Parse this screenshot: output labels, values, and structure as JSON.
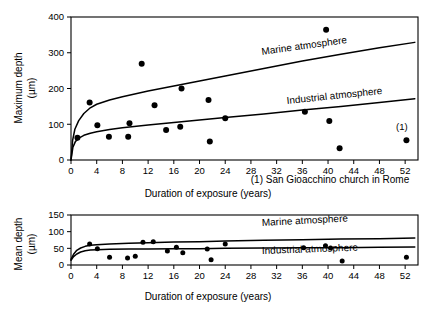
{
  "figure": {
    "footnote": "(1) San Gioacchino church in Rome",
    "point_annotation": "(1)"
  },
  "chart_data": [
    {
      "type": "scatter",
      "id": "maximum-depth",
      "title": "",
      "xlabel": "Duration of exposure (years)",
      "ylabel": "Maximum depth (µm)",
      "ylabel_line1": "Maximum depth",
      "ylabel_line2": "(µm)",
      "xlim": [
        0,
        54
      ],
      "ylim": [
        0,
        400
      ],
      "xticks": [
        0,
        4,
        8,
        12,
        16,
        20,
        24,
        28,
        32,
        36,
        40,
        44,
        48,
        52
      ],
      "yticks": [
        0,
        100,
        200,
        300,
        400
      ],
      "xticklabels": [
        "0",
        "4",
        "8",
        "12",
        "16",
        "20",
        "24",
        "28",
        "32",
        "36",
        "40",
        "44",
        "48",
        "52"
      ],
      "yticklabels": [
        "0",
        "100",
        "200",
        "300",
        "400"
      ],
      "grid": false,
      "legend_position": "inline-curve-labels",
      "points": [
        {
          "x": 1.0,
          "y": 62
        },
        {
          "x": 2.9,
          "y": 161
        },
        {
          "x": 4.1,
          "y": 97
        },
        {
          "x": 5.9,
          "y": 65
        },
        {
          "x": 8.9,
          "y": 65
        },
        {
          "x": 9.1,
          "y": 103
        },
        {
          "x": 11.0,
          "y": 269
        },
        {
          "x": 13.0,
          "y": 153
        },
        {
          "x": 14.8,
          "y": 84
        },
        {
          "x": 17.0,
          "y": 93
        },
        {
          "x": 17.2,
          "y": 200
        },
        {
          "x": 21.4,
          "y": 168
        },
        {
          "x": 21.6,
          "y": 52
        },
        {
          "x": 24.0,
          "y": 117
        },
        {
          "x": 36.4,
          "y": 135
        },
        {
          "x": 39.7,
          "y": 364
        },
        {
          "x": 40.2,
          "y": 109
        },
        {
          "x": 41.8,
          "y": 33
        },
        {
          "x": 52.2,
          "y": 55
        }
      ],
      "series": [
        {
          "name": "Marine atmosphere",
          "label": "Marine atmosphere",
          "curve": [
            {
              "x": 0.0,
              "y": 0
            },
            {
              "x": 0.25,
              "y": 55
            },
            {
              "x": 0.6,
              "y": 86
            },
            {
              "x": 1.2,
              "y": 110
            },
            {
              "x": 2.0,
              "y": 130
            },
            {
              "x": 3.0,
              "y": 146
            },
            {
              "x": 4.0,
              "y": 156
            },
            {
              "x": 6.0,
              "y": 168
            },
            {
              "x": 8.0,
              "y": 177
            },
            {
              "x": 12.0,
              "y": 193
            },
            {
              "x": 16.0,
              "y": 207
            },
            {
              "x": 20.0,
              "y": 221
            },
            {
              "x": 24.0,
              "y": 235
            },
            {
              "x": 30.0,
              "y": 256
            },
            {
              "x": 36.0,
              "y": 277
            },
            {
              "x": 42.0,
              "y": 296
            },
            {
              "x": 48.0,
              "y": 314
            },
            {
              "x": 53.5,
              "y": 329
            }
          ]
        },
        {
          "name": "Industrial atmosphere",
          "label": "Industrial atmosphere",
          "curve": [
            {
              "x": 0.0,
              "y": 0
            },
            {
              "x": 0.3,
              "y": 36
            },
            {
              "x": 0.7,
              "y": 52
            },
            {
              "x": 1.3,
              "y": 62
            },
            {
              "x": 2.0,
              "y": 69
            },
            {
              "x": 3.0,
              "y": 75
            },
            {
              "x": 4.0,
              "y": 79
            },
            {
              "x": 6.0,
              "y": 85
            },
            {
              "x": 8.0,
              "y": 90
            },
            {
              "x": 12.0,
              "y": 98
            },
            {
              "x": 16.0,
              "y": 105
            },
            {
              "x": 20.0,
              "y": 112
            },
            {
              "x": 24.0,
              "y": 119
            },
            {
              "x": 30.0,
              "y": 129
            },
            {
              "x": 36.0,
              "y": 140
            },
            {
              "x": 42.0,
              "y": 150
            },
            {
              "x": 48.0,
              "y": 161
            },
            {
              "x": 53.5,
              "y": 171
            }
          ]
        }
      ]
    },
    {
      "type": "scatter",
      "id": "mean-depth",
      "title": "",
      "xlabel": "Duration of exposure (years)",
      "ylabel": "Mean depth (µm)",
      "ylabel_line1": "Mean depth",
      "ylabel_line2": "(µm)",
      "xlim": [
        0,
        54
      ],
      "ylim": [
        0,
        150
      ],
      "xticks": [
        0,
        4,
        8,
        12,
        16,
        20,
        24,
        28,
        32,
        36,
        40,
        44,
        48,
        52
      ],
      "yticks": [
        0,
        50,
        100,
        150
      ],
      "xticklabels": [
        "0",
        "4",
        "8",
        "12",
        "16",
        "20",
        "24",
        "28",
        "32",
        "36",
        "40",
        "44",
        "48",
        "52"
      ],
      "yticklabels": [
        "0",
        "50",
        "100",
        "150"
      ],
      "grid": false,
      "legend_position": "inline-curve-labels",
      "points": [
        {
          "x": 2.9,
          "y": 63
        },
        {
          "x": 4.1,
          "y": 49
        },
        {
          "x": 6.0,
          "y": 23
        },
        {
          "x": 8.8,
          "y": 21
        },
        {
          "x": 10.0,
          "y": 26
        },
        {
          "x": 11.2,
          "y": 68
        },
        {
          "x": 12.8,
          "y": 70
        },
        {
          "x": 15.0,
          "y": 42
        },
        {
          "x": 16.4,
          "y": 53
        },
        {
          "x": 17.4,
          "y": 37
        },
        {
          "x": 21.2,
          "y": 48
        },
        {
          "x": 21.8,
          "y": 16
        },
        {
          "x": 24.0,
          "y": 63
        },
        {
          "x": 36.2,
          "y": 52
        },
        {
          "x": 39.6,
          "y": 58
        },
        {
          "x": 40.4,
          "y": 51
        },
        {
          "x": 42.2,
          "y": 12
        },
        {
          "x": 52.2,
          "y": 23
        }
      ],
      "series": [
        {
          "name": "Marine atmosphere",
          "label": "Marine atmosphere",
          "curve": [
            {
              "x": 0.0,
              "y": 17
            },
            {
              "x": 0.4,
              "y": 32
            },
            {
              "x": 0.9,
              "y": 44
            },
            {
              "x": 1.5,
              "y": 51
            },
            {
              "x": 2.2,
              "y": 56
            },
            {
              "x": 3.0,
              "y": 59
            },
            {
              "x": 4.0,
              "y": 61
            },
            {
              "x": 6.0,
              "y": 63
            },
            {
              "x": 9.0,
              "y": 65
            },
            {
              "x": 12.0,
              "y": 67
            },
            {
              "x": 16.0,
              "y": 69
            },
            {
              "x": 20.0,
              "y": 70
            },
            {
              "x": 24.0,
              "y": 72
            },
            {
              "x": 30.0,
              "y": 74
            },
            {
              "x": 36.0,
              "y": 76
            },
            {
              "x": 42.0,
              "y": 78
            },
            {
              "x": 48.0,
              "y": 79
            },
            {
              "x": 53.5,
              "y": 81
            }
          ]
        },
        {
          "name": "Industrial atmosphere",
          "label": "Industrial atmosphere",
          "curve": [
            {
              "x": 0.0,
              "y": 14
            },
            {
              "x": 0.4,
              "y": 25
            },
            {
              "x": 0.9,
              "y": 33
            },
            {
              "x": 1.5,
              "y": 39
            },
            {
              "x": 2.2,
              "y": 43
            },
            {
              "x": 3.0,
              "y": 45
            },
            {
              "x": 4.0,
              "y": 46
            },
            {
              "x": 6.0,
              "y": 47
            },
            {
              "x": 9.0,
              "y": 48
            },
            {
              "x": 12.0,
              "y": 48
            },
            {
              "x": 16.0,
              "y": 49
            },
            {
              "x": 20.0,
              "y": 49
            },
            {
              "x": 24.0,
              "y": 50
            },
            {
              "x": 30.0,
              "y": 51
            },
            {
              "x": 36.0,
              "y": 52
            },
            {
              "x": 42.0,
              "y": 52
            },
            {
              "x": 48.0,
              "y": 53
            },
            {
              "x": 53.5,
              "y": 54
            }
          ]
        }
      ]
    }
  ]
}
